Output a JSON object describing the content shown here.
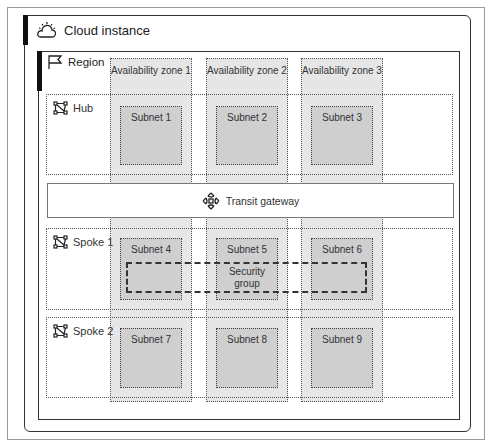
{
  "cloud": {
    "title": "Cloud instance",
    "icon": "cloud-sun-icon"
  },
  "region": {
    "title": "Region",
    "icon": "flag-icon"
  },
  "zones": [
    {
      "label": "Availability zone 1"
    },
    {
      "label": "Availability zone 2"
    },
    {
      "label": "Availability zone 3"
    }
  ],
  "rows": [
    {
      "label": "Hub",
      "icon": "network-icon"
    },
    {
      "label": "Spoke 1",
      "icon": "network-icon"
    },
    {
      "label": "Spoke 2",
      "icon": "network-icon"
    }
  ],
  "subnets": [
    "Subnet 1",
    "Subnet 2",
    "Subnet 3",
    "Subnet 4",
    "Subnet 5",
    "Subnet 6",
    "Subnet 7",
    "Subnet 8",
    "Subnet 9"
  ],
  "transit": {
    "label": "Transit gateway",
    "icon": "transit-gateway-icon"
  },
  "security_group": {
    "label": "Security group"
  },
  "colors": {
    "zone_fill": "#e6e6e6",
    "subnet_fill": "#cfcfcf",
    "border": "#333333"
  }
}
